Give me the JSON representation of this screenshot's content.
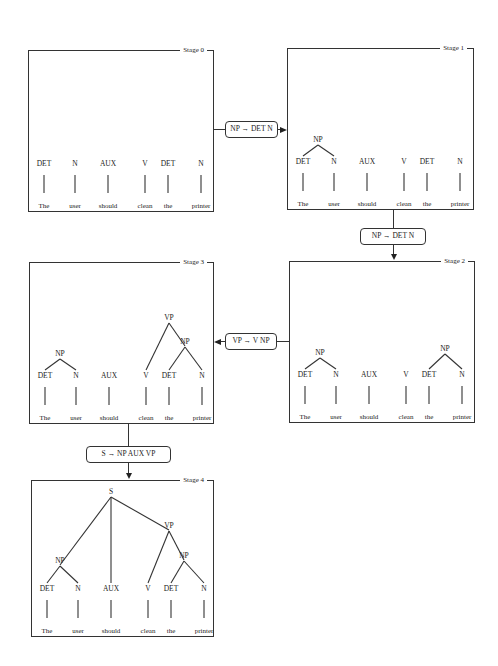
{
  "sentence": {
    "words": [
      "The",
      "user",
      "should",
      "clean",
      "the",
      "printer"
    ],
    "categories": [
      "DET",
      "N",
      "AUX",
      "V",
      "DET",
      "N"
    ],
    "column_x": [
      15,
      46,
      79,
      116,
      139,
      172
    ]
  },
  "stages": [
    {
      "label": "Stage 0",
      "box": {
        "x": 28,
        "y": 50,
        "w": 186,
        "h": 162
      },
      "phrases": []
    },
    {
      "label": "Stage 1",
      "box": {
        "x": 287,
        "y": 48,
        "w": 187,
        "h": 162
      },
      "phrases": [
        {
          "label": "NP",
          "x": 30,
          "y": 93,
          "children": [
            0,
            1
          ]
        }
      ]
    },
    {
      "label": "Stage 2",
      "box": {
        "x": 289,
        "y": 261,
        "w": 186,
        "h": 162
      },
      "phrases": [
        {
          "label": "NP",
          "x": 30,
          "y": 93,
          "children": [
            0,
            1
          ]
        },
        {
          "label": "NP",
          "x": 155,
          "y": 89,
          "children": [
            4,
            5
          ]
        }
      ]
    },
    {
      "label": "Stage 3",
      "box": {
        "x": 29,
        "y": 262,
        "w": 185,
        "h": 162
      },
      "phrases": [
        {
          "label": "NP",
          "x": 30,
          "y": 93,
          "children": [
            0,
            1
          ]
        },
        {
          "label": "NP",
          "x": 155,
          "y": 81,
          "children": [
            4,
            5
          ]
        },
        {
          "label": "VP",
          "x": 139,
          "y": 57,
          "children": [
            "V3",
            "P1"
          ]
        }
      ]
    },
    {
      "label": "Stage 4",
      "box": {
        "x": 31,
        "y": 480,
        "w": 183,
        "h": 157
      },
      "phrases": [
        {
          "label": "NP",
          "x": 28,
          "y": 87,
          "children": [
            0,
            1
          ]
        },
        {
          "label": "NP",
          "x": 152,
          "y": 82,
          "children": [
            4,
            5
          ]
        },
        {
          "label": "VP",
          "x": 137,
          "y": 52,
          "children": [
            "V3",
            "P1"
          ]
        },
        {
          "label": "S",
          "x": 79,
          "y": 18,
          "children": [
            "P0",
            "A2",
            "P2"
          ]
        }
      ]
    }
  ],
  "rules": [
    {
      "text": "NP → DET N",
      "from": "Stage 0",
      "to": "Stage 1",
      "box": {
        "x": 225,
        "y": 121,
        "w": 53,
        "h": 17
      }
    },
    {
      "text": "NP → DET  N",
      "from": "Stage 1",
      "to": "Stage 2",
      "box": {
        "x": 360,
        "y": 228,
        "w": 66,
        "h": 17
      }
    },
    {
      "text": "VP → V  NP",
      "from": "Stage 2",
      "to": "Stage 3",
      "box": {
        "x": 225,
        "y": 333,
        "w": 52,
        "h": 17
      }
    },
    {
      "text": "S → NP  AUX  VP",
      "from": "Stage 3",
      "to": "Stage 4",
      "box": {
        "x": 86,
        "y": 446,
        "w": 85,
        "h": 17
      }
    }
  ],
  "colors": {
    "line": "#333333",
    "text": "#222222",
    "background": "#ffffff"
  }
}
